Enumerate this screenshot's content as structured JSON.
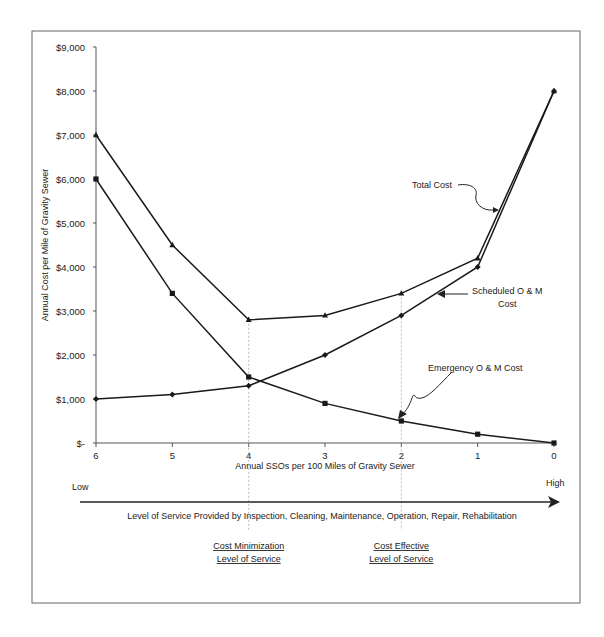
{
  "chart_data": {
    "type": "line",
    "title": "",
    "xlabel": "Annual SSOs per 100 Miles of Gravity Sewer",
    "ylabel": "Annual Cost per Mile of Gravity Sewer",
    "categories": [
      "6",
      "5",
      "4",
      "3",
      "2",
      "1",
      "0"
    ],
    "y_ticks": [
      "$-",
      "$1,000",
      "$2,000",
      "$3,000",
      "$4,000",
      "$5,000",
      "$6,000",
      "$7,000",
      "$8,000",
      "$9,000"
    ],
    "ylim": [
      0,
      9000
    ],
    "grid": false,
    "legend": "none (inline annotations with arrows)",
    "series": [
      {
        "name": "Total Cost",
        "marker": "triangle",
        "values": [
          7000,
          4500,
          2800,
          2900,
          3400,
          4200,
          8000
        ]
      },
      {
        "name": "Scheduled O & M Cost",
        "marker": "diamond",
        "values": [
          1000,
          1100,
          1300,
          2000,
          2900,
          4000,
          8000
        ]
      },
      {
        "name": "Emergency O & M Cost",
        "marker": "square",
        "values": [
          6000,
          3400,
          1500,
          900,
          500,
          200,
          0
        ]
      }
    ],
    "annotations": {
      "total_cost": "Total Cost",
      "scheduled_line1": "Scheduled O & M",
      "scheduled_line2": "Cost",
      "emergency": "Emergency O & M Cost"
    },
    "service_arrow": {
      "low": "Low",
      "high": "High",
      "caption": "Level of Service Provided by Inspection, Cleaning, Maintenance, Operation, Repair, Rehabilitation"
    },
    "markers_below": [
      {
        "at_category": "4",
        "line1": "Cost  Minimization",
        "line2": "Level of Service"
      },
      {
        "at_category": "2",
        "line1": "Cost  Effective",
        "line2": "Level of Service"
      }
    ]
  }
}
